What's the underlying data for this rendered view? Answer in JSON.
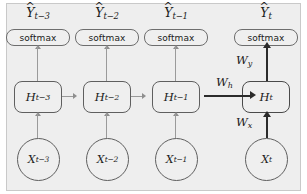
{
  "diagram": {
    "background_color": "#eeeeee",
    "node_fill": "#efefef",
    "node_stroke": "#5f5f5f",
    "thin_arrow_color": "#9a9a9a",
    "bold_arrow_color": "#2b2b2b",
    "columns": [
      {
        "timestep": "t-3",
        "output_label": "Y",
        "output_hat": "^",
        "output_sub": "t−3",
        "activation_label": "softmax",
        "hidden_label": "H",
        "hidden_sub": "t−3",
        "input_label": "X",
        "input_sub": "t−3"
      },
      {
        "timestep": "t-2",
        "output_label": "Y",
        "output_hat": "^",
        "output_sub": "t−2",
        "activation_label": "softmax",
        "hidden_label": "H",
        "hidden_sub": "t−2",
        "input_label": "X",
        "input_sub": "t−2"
      },
      {
        "timestep": "t-1",
        "output_label": "Y",
        "output_hat": "^",
        "output_sub": "t−1",
        "activation_label": "softmax",
        "hidden_label": "H",
        "hidden_sub": "t−1",
        "input_label": "X",
        "input_sub": "t−1"
      },
      {
        "timestep": "t",
        "output_label": "Y",
        "output_hat": "^",
        "output_sub": "t",
        "activation_label": "softmax",
        "hidden_label": "H",
        "hidden_sub": "t",
        "input_label": "X",
        "input_sub": "t"
      }
    ],
    "weights": [
      {
        "symbol": "W",
        "sub": "h",
        "role": "hidden-to-hidden"
      },
      {
        "symbol": "W",
        "sub": "y",
        "role": "hidden-to-output"
      },
      {
        "symbol": "W",
        "sub": "x",
        "role": "input-to-hidden"
      }
    ]
  }
}
